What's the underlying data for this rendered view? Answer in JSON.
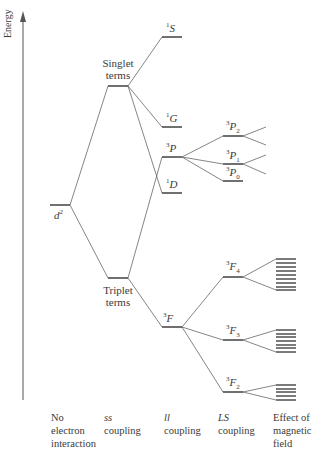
{
  "diagram": {
    "axis_label": "Energy",
    "configuration": {
      "label": "d",
      "superscript": "2"
    },
    "groups": {
      "singlet": {
        "line1": "Singlet",
        "line2": "terms"
      },
      "triplet": {
        "line1": "Triplet",
        "line2": "terms"
      }
    },
    "terms": {
      "1S": {
        "sup": "1",
        "letter": "S",
        "sub": ""
      },
      "1G": {
        "sup": "1",
        "letter": "G",
        "sub": ""
      },
      "3P": {
        "sup": "3",
        "letter": "P",
        "sub": ""
      },
      "1D": {
        "sup": "1",
        "letter": "D",
        "sub": ""
      },
      "3F": {
        "sup": "3",
        "letter": "F",
        "sub": ""
      },
      "3P2": {
        "sup": "3",
        "letter": "P",
        "sub": "2"
      },
      "3P1": {
        "sup": "3",
        "letter": "P",
        "sub": "1"
      },
      "3P0": {
        "sup": "3",
        "letter": "P",
        "sub": "0"
      },
      "3F4": {
        "sup": "3",
        "letter": "F",
        "sub": "4"
      },
      "3F3": {
        "sup": "3",
        "letter": "F",
        "sub": "3"
      },
      "3F2": {
        "sup": "3",
        "letter": "F",
        "sub": "2"
      }
    },
    "columns": [
      {
        "italic": "",
        "lines": [
          "No",
          "electron",
          "interaction"
        ]
      },
      {
        "italic": "ss",
        "lines": [
          "coupling"
        ]
      },
      {
        "italic": "ll",
        "lines": [
          "coupling"
        ]
      },
      {
        "italic": "LS",
        "lines": [
          "coupling"
        ]
      },
      {
        "italic": "",
        "lines": [
          "Effect of",
          "magnetic",
          "field"
        ]
      }
    ],
    "line_color": "#555555",
    "level_color": "#333333"
  }
}
